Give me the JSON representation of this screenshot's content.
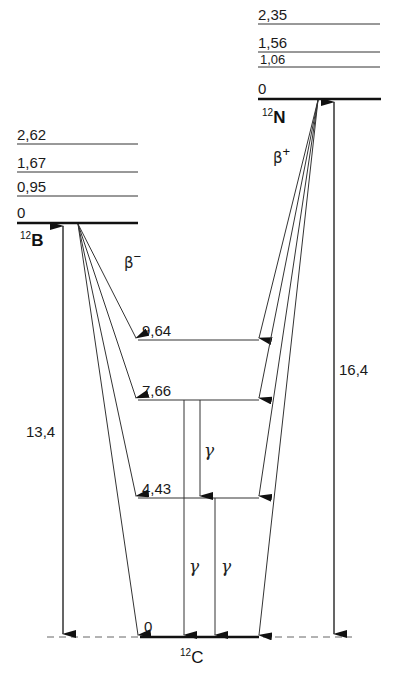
{
  "diagram": {
    "type": "nuclear-energy-level-diagram",
    "nuclei": {
      "boron": {
        "mass_number": "12",
        "symbol": "B",
        "levels": [
          "2,62",
          "1,67",
          "0,95",
          "0"
        ],
        "decay_label": "β",
        "decay_sign": "−",
        "q_value": "13,4"
      },
      "nitrogen": {
        "mass_number": "12",
        "symbol": "N",
        "levels": [
          "2,35",
          "1,56",
          "1,06",
          "0"
        ],
        "decay_label": "β",
        "decay_sign": "+",
        "q_value": "16,4"
      },
      "carbon": {
        "mass_number": "12",
        "symbol": "C",
        "levels": [
          "9,64",
          "7,66",
          "4,43",
          "0"
        ]
      }
    },
    "gamma": {
      "label": "γ",
      "transitions": [
        {
          "from": "7,66",
          "to": "0"
        },
        {
          "from": "7,66",
          "to": "4,43"
        },
        {
          "from": "4,43",
          "to": "0"
        }
      ]
    }
  }
}
